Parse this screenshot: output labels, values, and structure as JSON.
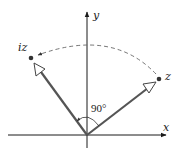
{
  "diagram": {
    "axes": {
      "x_label": "x",
      "y_label": "y"
    },
    "vectors": [
      {
        "name": "z",
        "label": "z",
        "point": [
          159,
          79
        ]
      },
      {
        "name": "iz",
        "label": "iz",
        "point": [
          31,
          58
        ]
      }
    ],
    "angle_label": "90°",
    "colors": {
      "axis": "#1a1a1a",
      "vector": "#555555",
      "dashed_arc": "#666666",
      "point": "#333333",
      "background": "#ffffff"
    }
  }
}
